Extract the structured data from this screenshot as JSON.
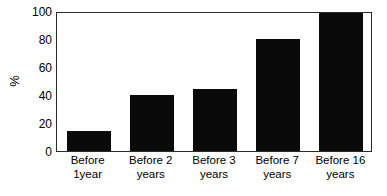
{
  "chart_data": {
    "type": "bar",
    "title": "",
    "subtitle": "",
    "xlabel": "",
    "ylabel": "%",
    "categories": [
      "Before 1year",
      "Before 2 years",
      "Before 3 years",
      "Before 7 years",
      "Before 16 years"
    ],
    "category_lines": [
      [
        "Before",
        "1year"
      ],
      [
        "Before 2",
        "years"
      ],
      [
        "Before 3",
        "years"
      ],
      [
        "Before 7",
        "years"
      ],
      [
        "Before 16",
        "years"
      ]
    ],
    "values": [
      14,
      40,
      44,
      80,
      100
    ],
    "ylim": [
      0,
      100
    ],
    "yticks": [
      0,
      20,
      40,
      60,
      80,
      100
    ],
    "ytick_labels": [
      "0",
      "20",
      "40",
      "60",
      "80",
      "100"
    ],
    "grid": false,
    "legend": false,
    "bar_color": "#0a0a0a",
    "frame_color": "#2b2b2b",
    "background_color": "#ffffff"
  },
  "axis": {
    "y_title": "%",
    "y_tick_0": "0",
    "y_tick_20": "20",
    "y_tick_40": "40",
    "y_tick_60": "60",
    "y_tick_80": "80",
    "y_tick_100": "100"
  },
  "bars": [
    {
      "label_line1": "Before",
      "label_line2": "1year",
      "value": 14
    },
    {
      "label_line1": "Before 2",
      "label_line2": "years",
      "value": 40
    },
    {
      "label_line1": "Before 3",
      "label_line2": "years",
      "value": 44
    },
    {
      "label_line1": "Before 7",
      "label_line2": "years",
      "value": 80
    },
    {
      "label_line1": "Before 16",
      "label_line2": "years",
      "value": 100
    }
  ]
}
